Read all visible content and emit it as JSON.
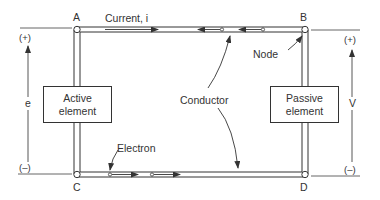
{
  "diagram": {
    "type": "circuit",
    "nodes": {
      "a": "A",
      "b": "B",
      "c": "C",
      "d": "D"
    },
    "elements": {
      "active": {
        "line1": "Active",
        "line2": "element"
      },
      "passive": {
        "line1": "Passive",
        "line2": "element"
      }
    },
    "labels": {
      "current": "Current, i",
      "node": "Node",
      "conductor": "Conductor",
      "electron": "Electron",
      "emf": "e",
      "voltage": "V",
      "left_plus": "(+)",
      "left_minus": "(–)",
      "right_plus": "(+)",
      "right_minus": "(–)"
    },
    "colors": {
      "stroke": "#333333",
      "background": "#ffffff"
    }
  }
}
